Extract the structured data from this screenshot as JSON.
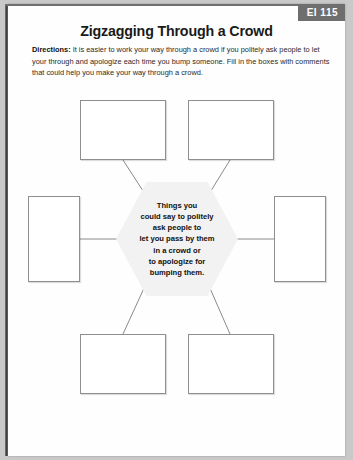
{
  "page": {
    "badge": "EI 115",
    "title": "Zigzagging Through a Crowd",
    "directions_label": "Directions:",
    "directions_text": " It is easier to work your way through a crowd if you politely ask people to let your through and apologize each time you bump someone.  Fill in the boxes with comments that could help you make your way through a crowd."
  },
  "diagram": {
    "center": {
      "text": "Things you\ncould say to politely\nask people to\nlet you  pass by them\nin a crowd or\nto apologize for\nbumping them."
    },
    "boxes": [
      {
        "position": "top-left",
        "value": ""
      },
      {
        "position": "top-right",
        "value": ""
      },
      {
        "position": "middle-left",
        "value": ""
      },
      {
        "position": "middle-right",
        "value": ""
      },
      {
        "position": "bottom-left",
        "value": ""
      },
      {
        "position": "bottom-right",
        "value": ""
      }
    ]
  },
  "colors": {
    "badge_background": "#6e6e6e",
    "badge_text": "#ffffff",
    "hexagon_fill": "#f2f2f2",
    "box_border": "#8e8e8e",
    "page_background": "#c9c9c9",
    "sheet_background": "#fefefe",
    "connector_line": "#8a8a8a"
  }
}
